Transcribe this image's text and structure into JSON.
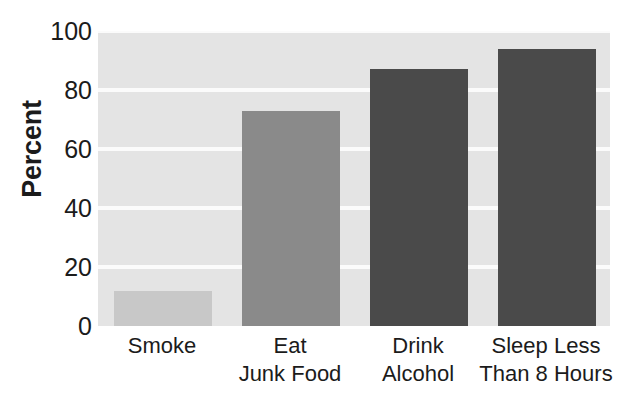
{
  "chart_data": {
    "type": "bar",
    "title": "",
    "subtitle": "",
    "xlabel": "",
    "ylabel": "Percent",
    "ylim": [
      0,
      100
    ],
    "yticks": [
      0,
      20,
      40,
      60,
      80,
      100
    ],
    "ytick_labels": [
      "0",
      "20",
      "40",
      "60",
      "80",
      "100"
    ],
    "grid": "horizontal-white-gridlines",
    "legend": "none",
    "categories": [
      "Smoke",
      "Eat Junk Food",
      "Drink Alcohol",
      "Sleep Less Than 8 Hours"
    ],
    "category_lines": [
      [
        "Smoke",
        ""
      ],
      [
        "Eat",
        "Junk Food"
      ],
      [
        "Drink",
        "Alcohol"
      ],
      [
        "Sleep Less",
        "Than 8 Hours"
      ]
    ],
    "values": [
      12,
      73,
      87,
      94
    ],
    "bar_colors": [
      "#c8c8c8",
      "#8a8a8a",
      "#4a4a4a",
      "#4a4a4a"
    ],
    "plot_background": "#e4e4e4",
    "gridline_color": "#fbfbfb",
    "text_color": "#1b1b1b"
  }
}
